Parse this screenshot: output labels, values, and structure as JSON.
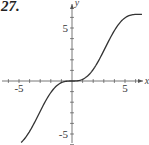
{
  "problem_number": "27.",
  "chart_data": {
    "type": "line",
    "title": "",
    "xlabel": "x",
    "ylabel": "y",
    "function_estimate": "y = x - sin(x)",
    "xlim": [
      -6.5,
      7.0
    ],
    "ylim": [
      -6.0,
      7.5
    ],
    "x_ticks": [
      -6,
      -5,
      -4,
      -3,
      -2,
      -1,
      1,
      2,
      3,
      4,
      5,
      6
    ],
    "y_ticks": [
      -6,
      -5,
      -4,
      -3,
      -2,
      -1,
      1,
      2,
      3,
      4,
      5,
      6
    ],
    "x_tick_labels": [
      "-5",
      "5"
    ],
    "y_tick_labels": [
      "5",
      "-5"
    ],
    "grid": false,
    "legend": null,
    "series": [
      {
        "name": "f",
        "x": [
          -4.8,
          -4.0,
          -3.0,
          -2.0,
          -1.0,
          0.0,
          1.0,
          2.0,
          3.0,
          4.0,
          5.0,
          6.0,
          6.6
        ],
        "values": [
          -5.8,
          -4.76,
          -2.86,
          -1.09,
          -0.16,
          0.0,
          0.16,
          1.09,
          2.86,
          4.76,
          5.96,
          6.28,
          6.29
        ]
      }
    ],
    "colors": {
      "curve": "#333333",
      "axes": "#555555"
    }
  }
}
